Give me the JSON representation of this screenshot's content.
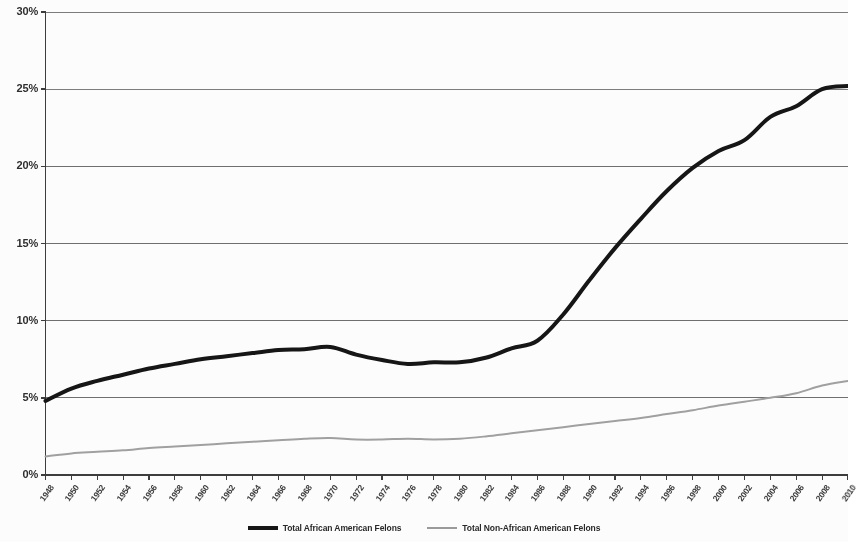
{
  "chart_data": {
    "type": "line",
    "title": "",
    "subtitle": "",
    "xlabel": "",
    "ylabel": "",
    "ylim": [
      0,
      30
    ],
    "xlim": [
      1948,
      2010
    ],
    "grid": true,
    "grid_axis": "y",
    "legend_position": "bottom",
    "y_ticks": [
      "0%",
      "5%",
      "10%",
      "15%",
      "20%",
      "25%",
      "30%"
    ],
    "y_tick_values": [
      0,
      5,
      10,
      15,
      20,
      25,
      30
    ],
    "categories": [
      "1948",
      "1950",
      "1952",
      "1954",
      "1956",
      "1958",
      "1960",
      "1962",
      "1964",
      "1966",
      "1968",
      "1970",
      "1972",
      "1974",
      "1976",
      "1978",
      "1980",
      "1982",
      "1984",
      "1986",
      "1988",
      "1990",
      "1992",
      "1994",
      "1996",
      "1998",
      "2000",
      "2002",
      "2004",
      "2006",
      "2008",
      "2010"
    ],
    "series": [
      {
        "name": "Total African American Felons",
        "color": "#111111",
        "width": 4,
        "values": [
          4.8,
          5.6,
          6.1,
          6.5,
          6.9,
          7.2,
          7.5,
          7.7,
          7.9,
          8.1,
          8.15,
          8.3,
          7.8,
          7.45,
          7.2,
          7.3,
          7.3,
          7.6,
          8.2,
          8.7,
          10.4,
          12.6,
          14.7,
          16.6,
          18.4,
          19.9,
          21.0,
          21.7,
          23.2,
          23.9,
          25.0,
          25.2
        ]
      },
      {
        "name": "Total Non-African American Felons",
        "color": "#a0a0a0",
        "width": 2,
        "values": [
          1.2,
          1.4,
          1.5,
          1.6,
          1.75,
          1.85,
          1.95,
          2.05,
          2.15,
          2.25,
          2.35,
          2.4,
          2.3,
          2.3,
          2.35,
          2.3,
          2.35,
          2.5,
          2.7,
          2.9,
          3.1,
          3.3,
          3.5,
          3.7,
          3.95,
          4.2,
          4.5,
          4.75,
          5.0,
          5.3,
          5.8,
          6.1
        ]
      }
    ]
  },
  "legend": {
    "items": [
      {
        "label": "Total African American Felons",
        "style": "black"
      },
      {
        "label": "Total Non-African American Felons",
        "style": "gray"
      }
    ]
  },
  "axes": {
    "y_axis_name": "percent-axis",
    "x_axis_name": "year-axis"
  }
}
